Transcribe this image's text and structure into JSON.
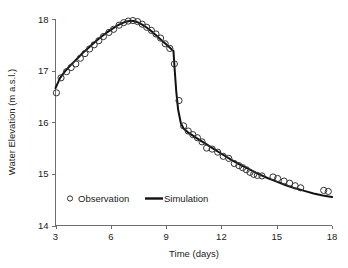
{
  "chart_data": {
    "type": "line",
    "title": "",
    "xlabel": "Time (days)",
    "ylabel": "Water Elevation (m a.s.l.)",
    "xlim": [
      3,
      18
    ],
    "ylim": [
      14,
      18
    ],
    "xticks": [
      3,
      6,
      9,
      12,
      15,
      18
    ],
    "yticks": [
      14,
      15,
      16,
      17,
      18
    ],
    "xtick_labels": [
      "3",
      "6",
      "9",
      "12",
      "15",
      "18"
    ],
    "ytick_labels": [
      "14",
      "15",
      "16",
      "17",
      "18"
    ],
    "grid": false,
    "legend_position": "inside-lower-left",
    "series": [
      {
        "name": "Observation",
        "type": "scatter",
        "marker": "open-circle",
        "color": "#333333",
        "points": [
          [
            3.05,
            16.57
          ],
          [
            3.3,
            16.86
          ],
          [
            3.6,
            16.98
          ],
          [
            3.85,
            17.06
          ],
          [
            4.1,
            17.13
          ],
          [
            4.35,
            17.24
          ],
          [
            4.6,
            17.33
          ],
          [
            4.85,
            17.42
          ],
          [
            5.1,
            17.5
          ],
          [
            5.35,
            17.58
          ],
          [
            5.6,
            17.66
          ],
          [
            5.9,
            17.74
          ],
          [
            6.15,
            17.8
          ],
          [
            6.45,
            17.88
          ],
          [
            6.7,
            17.93
          ],
          [
            6.95,
            17.96
          ],
          [
            7.2,
            17.97
          ],
          [
            7.45,
            17.95
          ],
          [
            7.7,
            17.9
          ],
          [
            7.95,
            17.84
          ],
          [
            8.2,
            17.78
          ],
          [
            8.45,
            17.71
          ],
          [
            8.7,
            17.63
          ],
          [
            8.95,
            17.52
          ],
          [
            9.2,
            17.43
          ],
          [
            9.45,
            17.13
          ],
          [
            9.7,
            16.42
          ],
          [
            9.95,
            15.93
          ],
          [
            10.2,
            15.83
          ],
          [
            10.45,
            15.76
          ],
          [
            10.7,
            15.7
          ],
          [
            10.95,
            15.62
          ],
          [
            11.2,
            15.5
          ],
          [
            11.5,
            15.48
          ],
          [
            11.8,
            15.42
          ],
          [
            12.1,
            15.34
          ],
          [
            12.4,
            15.3
          ],
          [
            12.7,
            15.2
          ],
          [
            12.95,
            15.16
          ],
          [
            13.15,
            15.12
          ],
          [
            13.35,
            15.08
          ],
          [
            13.55,
            15.03
          ],
          [
            13.75,
            14.99
          ],
          [
            13.95,
            14.97
          ],
          [
            14.2,
            14.96
          ],
          [
            14.8,
            14.94
          ],
          [
            15.05,
            14.91
          ],
          [
            15.4,
            14.86
          ],
          [
            15.7,
            14.82
          ],
          [
            16.0,
            14.77
          ],
          [
            16.3,
            14.73
          ],
          [
            17.55,
            14.68
          ],
          [
            17.8,
            14.66
          ]
        ]
      },
      {
        "name": "Simulation",
        "type": "line",
        "color": "#111111",
        "points": [
          [
            3.0,
            16.66
          ],
          [
            3.25,
            16.86
          ],
          [
            3.5,
            16.98
          ],
          [
            3.75,
            17.08
          ],
          [
            4.0,
            17.17
          ],
          [
            4.25,
            17.26
          ],
          [
            4.5,
            17.35
          ],
          [
            4.75,
            17.43
          ],
          [
            5.0,
            17.51
          ],
          [
            5.25,
            17.59
          ],
          [
            5.5,
            17.66
          ],
          [
            5.75,
            17.73
          ],
          [
            6.0,
            17.79
          ],
          [
            6.25,
            17.85
          ],
          [
            6.5,
            17.9
          ],
          [
            6.75,
            17.94
          ],
          [
            7.0,
            17.96
          ],
          [
            7.25,
            17.96
          ],
          [
            7.5,
            17.93
          ],
          [
            7.75,
            17.88
          ],
          [
            8.0,
            17.82
          ],
          [
            8.25,
            17.75
          ],
          [
            8.5,
            17.67
          ],
          [
            8.75,
            17.59
          ],
          [
            9.0,
            17.51
          ],
          [
            9.25,
            17.43
          ],
          [
            9.4,
            17.38
          ],
          [
            9.45,
            17.1
          ],
          [
            9.55,
            16.6
          ],
          [
            9.65,
            16.25
          ],
          [
            9.8,
            15.98
          ],
          [
            9.95,
            15.88
          ],
          [
            10.2,
            15.8
          ],
          [
            10.5,
            15.73
          ],
          [
            10.8,
            15.66
          ],
          [
            11.2,
            15.57
          ],
          [
            11.6,
            15.48
          ],
          [
            12.0,
            15.39
          ],
          [
            12.5,
            15.28
          ],
          [
            13.0,
            15.18
          ],
          [
            13.5,
            15.09
          ],
          [
            14.0,
            15.0
          ],
          [
            14.5,
            14.92
          ],
          [
            15.0,
            14.85
          ],
          [
            15.5,
            14.78
          ],
          [
            16.0,
            14.72
          ],
          [
            16.5,
            14.67
          ],
          [
            17.0,
            14.62
          ],
          [
            17.5,
            14.58
          ],
          [
            18.0,
            14.55
          ]
        ]
      }
    ],
    "legend": [
      {
        "label": "Observation",
        "marker": "open-circle"
      },
      {
        "label": "Simulation",
        "marker": "line"
      }
    ]
  },
  "axes": {
    "x_title": "Time (days)",
    "y_title": "Water Elevation (m a.s.l.)"
  },
  "legend": {
    "observation_label": "Observation",
    "simulation_label": "Simulation"
  },
  "colors": {
    "simulation_line": "#111111",
    "observation_marker": "#333333",
    "axis": "#6e6e6e",
    "background": "#ffffff"
  }
}
